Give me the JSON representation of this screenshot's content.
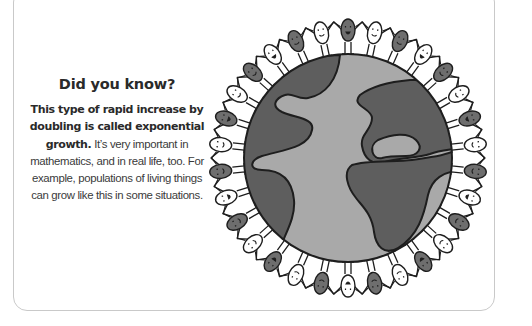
{
  "card": {
    "title": "Did you know?",
    "bold_lead": "This type of rapid increase by doubling is called exponential growth.",
    "body": " It’s very important in mathematics, and in real life, too. For example, populations of living things can grow like this in some situations."
  },
  "illustration": {
    "subject": "globe-with-people-holding-hands-around-it",
    "colors": {
      "ocean": "#a9a9a9",
      "land": "#5e5e5e",
      "outline": "#1e1e1e",
      "person_dark": "#6e6e6e",
      "person_light": "#ffffff"
    },
    "people_count": 30
  }
}
